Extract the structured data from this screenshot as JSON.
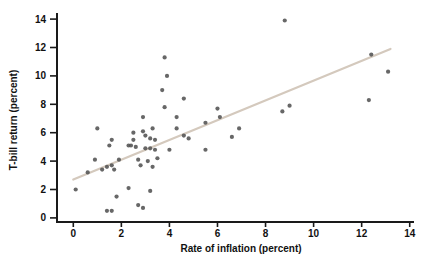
{
  "figure": {
    "background": "#ffffff",
    "dot_color": "#565656",
    "trend_line_color": "#d4c9bd",
    "axis_color": "#1a1a1a",
    "text_color": "#111111"
  },
  "chart_data": {
    "type": "scatter",
    "title": "",
    "xlabel": "Rate of inflation (percent)",
    "ylabel": "T-bill return (percent)",
    "xlim": [
      0,
      14
    ],
    "ylim": [
      0,
      14
    ],
    "xticks": [
      0,
      2,
      4,
      6,
      8,
      10,
      12,
      14
    ],
    "yticks": [
      0,
      2,
      4,
      6,
      8,
      10,
      12,
      14
    ],
    "grid": false,
    "legend": "none",
    "points": [
      [
        0.1,
        2.0
      ],
      [
        0.6,
        3.2
      ],
      [
        0.9,
        4.1
      ],
      [
        1.0,
        6.3
      ],
      [
        1.2,
        3.4
      ],
      [
        1.4,
        3.6
      ],
      [
        1.6,
        3.7
      ],
      [
        1.7,
        3.4
      ],
      [
        1.9,
        4.1
      ],
      [
        1.6,
        5.5
      ],
      [
        1.5,
        5.1
      ],
      [
        1.4,
        0.5
      ],
      [
        1.6,
        0.5
      ],
      [
        1.8,
        1.5
      ],
      [
        2.3,
        2.1
      ],
      [
        3.2,
        1.9
      ],
      [
        2.7,
        0.9
      ],
      [
        2.9,
        0.7
      ],
      [
        2.5,
        5.5
      ],
      [
        2.5,
        6.0
      ],
      [
        2.9,
        6.1
      ],
      [
        2.9,
        7.1
      ],
      [
        3.0,
        5.8
      ],
      [
        3.3,
        6.3
      ],
      [
        3.2,
        5.6
      ],
      [
        3.4,
        5.5
      ],
      [
        2.3,
        5.1
      ],
      [
        2.4,
        5.1
      ],
      [
        2.6,
        5.0
      ],
      [
        3.0,
        4.9
      ],
      [
        3.2,
        4.9
      ],
      [
        3.4,
        4.8
      ],
      [
        4.0,
        4.8
      ],
      [
        3.5,
        4.2
      ],
      [
        2.7,
        4.1
      ],
      [
        3.1,
        4.0
      ],
      [
        2.8,
        3.7
      ],
      [
        3.3,
        3.6
      ],
      [
        3.8,
        11.3
      ],
      [
        3.9,
        10.0
      ],
      [
        3.7,
        9.0
      ],
      [
        3.8,
        7.8
      ],
      [
        4.3,
        7.1
      ],
      [
        4.3,
        6.3
      ],
      [
        4.6,
        5.8
      ],
      [
        4.8,
        5.6
      ],
      [
        4.6,
        8.4
      ],
      [
        5.5,
        6.7
      ],
      [
        5.5,
        4.8
      ],
      [
        6.0,
        7.7
      ],
      [
        6.1,
        7.1
      ],
      [
        6.9,
        6.3
      ],
      [
        6.6,
        5.7
      ],
      [
        8.7,
        7.5
      ],
      [
        9.0,
        7.9
      ],
      [
        8.8,
        13.9
      ],
      [
        12.4,
        11.5
      ],
      [
        13.1,
        10.3
      ],
      [
        12.3,
        8.3
      ]
    ],
    "trend_line": {
      "x1": 0.0,
      "y1": 2.7,
      "x2": 13.2,
      "y2": 11.9
    }
  }
}
